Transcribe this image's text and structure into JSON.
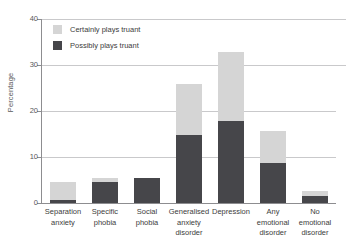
{
  "chart_data": {
    "type": "bar",
    "subtype": "stacked-bar",
    "title": "",
    "xlabel": "",
    "ylabel": "Percentage",
    "ylim": [
      0,
      40
    ],
    "yticks": [
      0,
      10,
      20,
      30,
      40
    ],
    "grid": true,
    "legend_position": "top-left-inside",
    "categories": [
      "Separation anxiety",
      "Specific phobia",
      "Social phobia",
      "Generalised anxiety disorder",
      "Depression",
      "Any emotional disorder",
      "No emotional disorder"
    ],
    "category_lines": [
      [
        "Separation",
        "anxiety"
      ],
      [
        "Specific",
        "phobia"
      ],
      [
        "Social",
        "phobia"
      ],
      [
        "Generalised",
        "anxiety",
        "disorder"
      ],
      [
        "Depression"
      ],
      [
        "Any",
        "emotional",
        "disorder"
      ],
      [
        "No",
        "emotional",
        "disorder"
      ]
    ],
    "series": [
      {
        "name": "Possibly plays truant",
        "color": "#46464a",
        "values": [
          0.7,
          4.5,
          5.5,
          14.7,
          17.9,
          8.7,
          1.6
        ]
      },
      {
        "name": "Certainly plays truant",
        "color": "#d5d5d5",
        "values": [
          3.8,
          1.0,
          0.0,
          11.1,
          14.9,
          7.0,
          1.0
        ]
      }
    ],
    "totals": [
      4.5,
      5.5,
      5.5,
      25.8,
      32.8,
      15.7,
      2.6
    ]
  },
  "axis": {
    "y_title": "Percentage",
    "y_ticks": [
      "0",
      "10",
      "20",
      "30",
      "40"
    ]
  },
  "legend": {
    "items": [
      {
        "label": "Certainly plays truant",
        "key": "certainly"
      },
      {
        "label": "Possibly plays truant",
        "key": "possibly"
      }
    ]
  },
  "colors": {
    "possibly": "#46464a",
    "certainly": "#d5d5d5",
    "gridline": "#c9c9cb",
    "axis": "#8d8d90",
    "text": "#3c3c3c"
  }
}
